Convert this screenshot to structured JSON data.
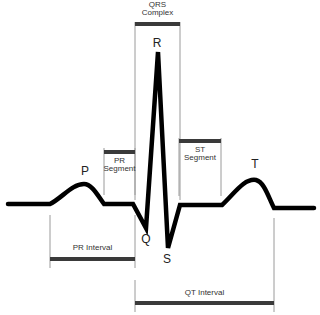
{
  "diagram": {
    "type": "ECG waveform (single cardiac cycle)",
    "wave_labels": {
      "p": "P",
      "q": "Q",
      "r": "R",
      "s": "S",
      "t": "T"
    },
    "segments": {
      "qrs_complex": {
        "line1": "QRS",
        "line2": "Complex"
      },
      "pr_segment": {
        "line1": "PR",
        "line2": "Segment"
      },
      "st_segment": {
        "line1": "ST",
        "line2": "Segment"
      }
    },
    "intervals": {
      "pr_interval": "PR Interval",
      "qt_interval": "QT Interval"
    },
    "colors": {
      "trace": "#000000",
      "bracket_bar": "#3a3a3a",
      "guide_line": "#9a9a9a",
      "text": "#333333",
      "background": "#ffffff"
    }
  }
}
